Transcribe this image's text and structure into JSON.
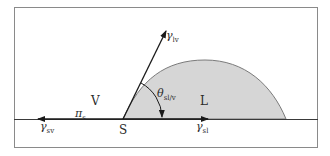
{
  "figure": {
    "regions": {
      "vapor": "V",
      "liquid": "L",
      "solid_contact_point": "S"
    },
    "vectors": {
      "gamma_lv": {
        "symbol": "γ",
        "subscript": "lv"
      },
      "gamma_sv": {
        "symbol": "γ",
        "subscript": "sv"
      },
      "gamma_sl": {
        "symbol": "γ",
        "subscript": "sl"
      }
    },
    "angle": {
      "symbol": "θ",
      "subscript": "sl/v"
    },
    "spreading_pressure": {
      "symbol": "π",
      "subscript": "s"
    },
    "colors": {
      "frame": "#8a8a8a",
      "lines": "#1a1a1a",
      "drop_fill": "#d6d6d6",
      "drop_outline": "#7a7a7a",
      "background": "#ffffff"
    }
  }
}
